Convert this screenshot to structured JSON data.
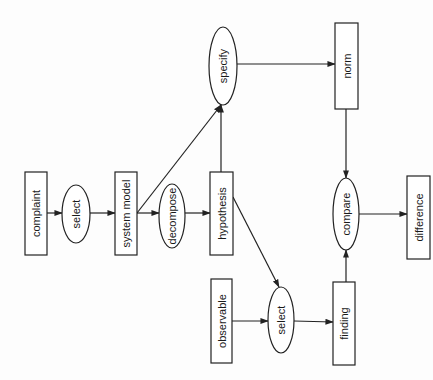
{
  "diagram": {
    "orientation": "rotated-90-ccw",
    "nodes": [
      {
        "id": "complaint",
        "label": "complaint",
        "shape": "rect",
        "x": 25,
        "y": 172,
        "w": 22,
        "h": 83
      },
      {
        "id": "select1",
        "label": "select",
        "shape": "ellipse",
        "cx": 76,
        "cy": 214,
        "rx": 14,
        "ry": 29
      },
      {
        "id": "system_model",
        "label": "system model",
        "shape": "rect",
        "x": 115,
        "y": 172,
        "w": 22,
        "h": 83
      },
      {
        "id": "decompose",
        "label": "decompose",
        "shape": "ellipse",
        "cx": 172,
        "cy": 216,
        "rx": 13,
        "ry": 32
      },
      {
        "id": "hypothesis",
        "label": "hypothesis",
        "shape": "rect",
        "x": 210,
        "y": 172,
        "w": 23,
        "h": 83
      },
      {
        "id": "specify",
        "label": "specify",
        "shape": "ellipse",
        "cx": 223,
        "cy": 66,
        "rx": 14,
        "ry": 39
      },
      {
        "id": "norm",
        "label": "norm",
        "shape": "rect",
        "x": 335,
        "y": 23,
        "w": 23,
        "h": 86
      },
      {
        "id": "observable",
        "label": "observable",
        "shape": "rect",
        "x": 211,
        "y": 279,
        "w": 21,
        "h": 84
      },
      {
        "id": "select2",
        "label": "select",
        "shape": "ellipse",
        "cx": 281,
        "cy": 320,
        "rx": 13,
        "ry": 33
      },
      {
        "id": "finding",
        "label": "finding",
        "shape": "rect",
        "x": 333,
        "y": 282,
        "w": 22,
        "h": 83
      },
      {
        "id": "compare",
        "label": "compare",
        "shape": "ellipse",
        "cx": 346,
        "cy": 214,
        "rx": 13,
        "ry": 36
      },
      {
        "id": "difference",
        "label": "difference",
        "shape": "rect",
        "x": 407,
        "y": 176,
        "w": 23,
        "h": 83
      }
    ],
    "edges": [
      {
        "from": "complaint",
        "to": "select1",
        "path": [
          [
            47,
            213
          ],
          [
            62,
            213
          ]
        ]
      },
      {
        "from": "select1",
        "to": "system_model",
        "path": [
          [
            90,
            213
          ],
          [
            115,
            213
          ]
        ]
      },
      {
        "from": "system_model",
        "to": "decompose",
        "path": [
          [
            137,
            213
          ],
          [
            159,
            213
          ]
        ]
      },
      {
        "from": "system_model",
        "to": "specify",
        "path": [
          [
            137,
            213
          ],
          [
            221,
            105
          ]
        ]
      },
      {
        "from": "decompose",
        "to": "hypothesis",
        "path": [
          [
            185,
            213
          ],
          [
            210,
            213
          ]
        ]
      },
      {
        "from": "hypothesis",
        "to": "specify",
        "path": [
          [
            221,
            172
          ],
          [
            221,
            105
          ]
        ]
      },
      {
        "from": "specify",
        "to": "norm",
        "path": [
          [
            237,
            64
          ],
          [
            335,
            64
          ]
        ]
      },
      {
        "from": "hypothesis",
        "to": "select2",
        "path": [
          [
            233,
            197
          ],
          [
            279,
            287
          ]
        ]
      },
      {
        "from": "observable",
        "to": "select2",
        "path": [
          [
            232,
            321
          ],
          [
            268,
            321
          ]
        ]
      },
      {
        "from": "select2",
        "to": "finding",
        "path": [
          [
            294,
            321
          ],
          [
            333,
            322
          ]
        ]
      },
      {
        "from": "norm",
        "to": "compare",
        "path": [
          [
            346,
            109
          ],
          [
            346,
            178
          ]
        ]
      },
      {
        "from": "finding",
        "to": "compare",
        "path": [
          [
            346,
            282
          ],
          [
            346,
            250
          ]
        ]
      },
      {
        "from": "compare",
        "to": "difference",
        "path": [
          [
            359,
            214
          ],
          [
            407,
            214
          ]
        ]
      }
    ],
    "colors": {
      "stroke": "#222222",
      "fill": "#ffffff",
      "background": "#fdfdfd",
      "text": "#1a1a1a"
    }
  }
}
